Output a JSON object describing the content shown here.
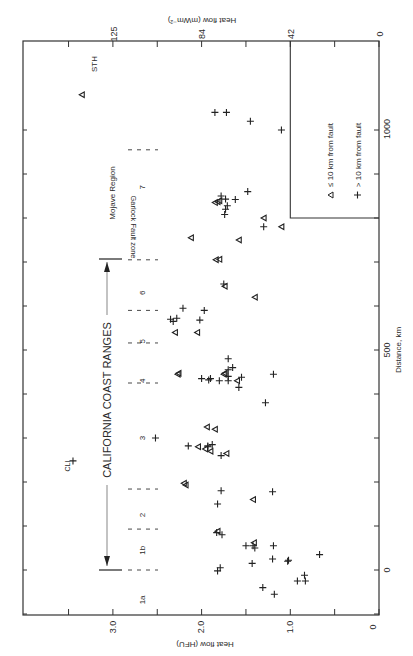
{
  "chart_data": {
    "type": "scatter",
    "orientation_note": "figure printed rotated 90°: heat flow runs along the horizontal axis (decreasing to the right), distance runs along the vertical axis (increasing upward)",
    "title": "",
    "xlabel": "Distance, km",
    "ylabel": "Heat flow (HFU)",
    "ylabel_secondary": "Heat flow (mWm⁻²)",
    "xlim": [
      -150,
      1150
    ],
    "ylim": [
      0,
      3.9
    ],
    "distance_ticks": [
      0,
      500,
      1000
    ],
    "distance_minor_step": 100,
    "hfu_ticks": [
      "0",
      "1.0",
      "2.0",
      "3.0"
    ],
    "hfu_tick_values": [
      0,
      1.0,
      2.0,
      3.0
    ],
    "hfu_minor_step": 0.5,
    "mwm_ticks": [
      "0",
      "42",
      "84",
      "125"
    ],
    "mwm_tick_values": [
      0,
      42,
      84,
      125
    ],
    "legend": [
      {
        "symbol": "triangle",
        "label": "≤ 10 km from fault"
      },
      {
        "symbol": "plus",
        "label": "> 10 km from fault"
      }
    ],
    "annotations": {
      "coast_ranges": "CALIFORNIA COAST RANGES",
      "garlock": "Garlock Fault zone",
      "mojave": "Mojave Region",
      "sth": "STH",
      "cli": "CLI"
    },
    "regions": [
      {
        "label": "1a",
        "km": -68
      },
      {
        "label": "1b",
        "km": 45
      },
      {
        "label": "2",
        "km": 125
      },
      {
        "label": "3",
        "km": 300
      },
      {
        "label": "4",
        "km": 430
      },
      {
        "label": "5",
        "km": 520
      },
      {
        "label": "6",
        "km": 630
      },
      {
        "label": "7",
        "km": 870
      }
    ],
    "region_boundaries_km": [
      0,
      93,
      184,
      425,
      516,
      590,
      705,
      955
    ],
    "legend_box": {
      "km_min": 800,
      "km_max": 1250,
      "hfu_min": 0,
      "hfu_max": 1.0
    },
    "series": [
      {
        "name": "≤ 10 km from fault",
        "symbol": "triangle",
        "points": [
          [
            1080,
            3.35
          ],
          [
            780,
            1.1
          ],
          [
            835,
            1.85
          ],
          [
            837,
            1.82
          ],
          [
            839,
            1.8
          ],
          [
            800,
            1.3
          ],
          [
            705,
            1.84
          ],
          [
            706,
            1.8
          ],
          [
            755,
            2.12
          ],
          [
            750,
            1.58
          ],
          [
            645,
            1.74
          ],
          [
            620,
            1.4
          ],
          [
            540,
            2.3
          ],
          [
            540,
            2.05
          ],
          [
            445,
            2.27
          ],
          [
            447,
            2.26
          ],
          [
            445,
            1.75
          ],
          [
            447,
            1.74
          ],
          [
            430,
            1.6
          ],
          [
            325,
            1.94
          ],
          [
            320,
            1.85
          ],
          [
            280,
            2.04
          ],
          [
            275,
            1.96
          ],
          [
            270,
            1.9
          ],
          [
            265,
            1.72
          ],
          [
            197,
            2.2
          ],
          [
            193,
            2.18
          ],
          [
            160,
            1.42
          ],
          [
            88,
            1.82
          ],
          [
            62,
            1.41
          ]
        ]
      },
      {
        "name": "> 10 km from fault",
        "symbol": "plus",
        "points": [
          [
            248,
            3.45
          ],
          [
            1040,
            1.85
          ],
          [
            1040,
            1.72
          ],
          [
            1020,
            1.45
          ],
          [
            1000,
            1.1
          ],
          [
            860,
            1.48
          ],
          [
            843,
            1.73
          ],
          [
            850,
            1.78
          ],
          [
            842,
            1.62
          ],
          [
            828,
            1.71
          ],
          [
            820,
            1.73
          ],
          [
            808,
            1.74
          ],
          [
            780,
            1.3
          ],
          [
            595,
            2.21
          ],
          [
            590,
            1.97
          ],
          [
            650,
            1.75
          ],
          [
            570,
            2.35
          ],
          [
            572,
            2.28
          ],
          [
            565,
            2.32
          ],
          [
            568,
            2.02
          ],
          [
            435,
            2.0
          ],
          [
            435,
            1.9
          ],
          [
            432,
            1.92
          ],
          [
            430,
            1.8
          ],
          [
            455,
            1.7
          ],
          [
            440,
            1.7
          ],
          [
            438,
            1.55
          ],
          [
            430,
            1.7
          ],
          [
            460,
            1.65
          ],
          [
            415,
            1.58
          ],
          [
            445,
            1.19
          ],
          [
            480,
            1.7
          ],
          [
            380,
            1.28
          ],
          [
            300,
            2.52
          ],
          [
            282,
            2.15
          ],
          [
            282,
            1.93
          ],
          [
            280,
            1.93
          ],
          [
            285,
            1.88
          ],
          [
            260,
            1.78
          ],
          [
            180,
            1.78
          ],
          [
            178,
            1.2
          ],
          [
            150,
            1.82
          ],
          [
            85,
            1.83
          ],
          [
            80,
            1.77
          ],
          [
            55,
            1.5
          ],
          [
            55,
            1.42
          ],
          [
            50,
            1.4
          ],
          [
            15,
            1.43
          ],
          [
            55,
            1.19
          ],
          [
            25,
            1.2
          ],
          [
            20,
            1.03
          ],
          [
            22,
            1.02
          ],
          [
            35,
            0.67
          ],
          [
            -12,
            0.84
          ],
          [
            -25,
            0.83
          ],
          [
            -25,
            0.92
          ],
          [
            -40,
            1.31
          ],
          [
            -55,
            1.18
          ],
          [
            -2,
            1.82
          ],
          [
            5,
            1.79
          ]
        ]
      }
    ]
  }
}
